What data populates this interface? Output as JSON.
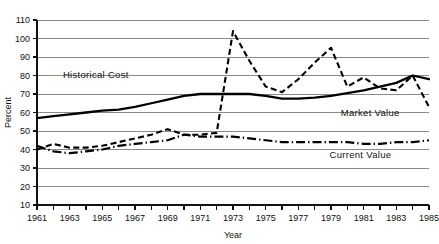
{
  "chart_data": {
    "type": "line",
    "title": "",
    "xlabel": "Year",
    "ylabel": "Percent",
    "xlim": [
      1961,
      1985
    ],
    "ylim": [
      10,
      110
    ],
    "ytick_step": 10,
    "yticks": [
      10,
      20,
      30,
      40,
      50,
      60,
      70,
      80,
      90,
      100,
      110
    ],
    "ytick_labels": [
      "10",
      "20",
      "30",
      "40",
      "50",
      "60",
      "70",
      "80",
      "90",
      "100",
      "110"
    ],
    "xticks": [
      1961,
      1962,
      1963,
      1964,
      1965,
      1966,
      1967,
      1968,
      1969,
      1970,
      1971,
      1972,
      1973,
      1974,
      1975,
      1976,
      1977,
      1978,
      1979,
      1980,
      1981,
      1982,
      1983,
      1984,
      1985
    ],
    "xtick_labels_shown": [
      "1961",
      "1963",
      "1965",
      "1967",
      "1969",
      "1971",
      "1973",
      "1975",
      "1977",
      "1979",
      "1981",
      "1983",
      "1985"
    ],
    "grid": "horizontal",
    "legend_position": "inline-annotations",
    "x": [
      1961,
      1962,
      1963,
      1964,
      1965,
      1966,
      1967,
      1968,
      1969,
      1970,
      1971,
      1972,
      1973,
      1974,
      1975,
      1976,
      1977,
      1978,
      1979,
      1980,
      1981,
      1982,
      1983,
      1984,
      1985
    ],
    "series": [
      {
        "name": "Historical Cost",
        "style": "solid",
        "label_x": 1964.6,
        "label_y": 78.5,
        "values": [
          57,
          58,
          59,
          60,
          61,
          61.5,
          63,
          65,
          67,
          69,
          70,
          70,
          70,
          70,
          69,
          67.5,
          67.5,
          68,
          69,
          70.5,
          72,
          74,
          76,
          80,
          78
        ]
      },
      {
        "name": "Market Value",
        "style": "dashed",
        "label_x": 1981.4,
        "label_y": 58,
        "values": [
          40,
          43,
          41,
          41,
          42,
          44,
          46,
          48,
          51,
          48,
          48,
          49,
          104,
          88,
          74,
          71,
          78,
          87,
          95,
          74,
          79,
          73,
          72,
          80,
          63
        ]
      },
      {
        "name": "Current Value",
        "style": "dashdot",
        "label_x": 1980.8,
        "label_y": 35.5,
        "values": [
          42,
          39,
          38,
          39,
          40,
          42,
          43,
          44,
          45,
          48,
          47,
          47,
          47,
          46,
          45,
          44,
          44,
          44,
          44,
          44,
          43,
          43,
          44,
          44,
          45
        ]
      }
    ]
  },
  "annotations": {
    "historical_cost": "Historical Cost",
    "market_value": "Market Value",
    "current_value": "Current Value"
  },
  "colors": {
    "line": "#000000",
    "grid": "#8a8a8a",
    "axis": "#111111",
    "background": "#ffffff"
  }
}
